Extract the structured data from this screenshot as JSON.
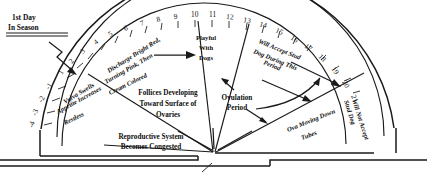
{
  "callout": {
    "line1": "1st Day",
    "line2": "In Season",
    "arrow_name": "first-day-arrow"
  },
  "scale": {
    "negative_days": [
      "-1",
      "-2",
      "-3",
      "-4"
    ],
    "positive_days": [
      "1",
      "2",
      "3",
      "4",
      "5",
      "6",
      "7",
      "8",
      "9",
      "10",
      "11",
      "12",
      "13",
      "14",
      "15",
      "16",
      "17",
      "18",
      "19",
      "20",
      "21"
    ],
    "axis_note": "Days of the season marked around the outer arc"
  },
  "outer_sectors": [
    {
      "name": "discharge",
      "lines": [
        "Discharge Bright Red,",
        "Turning Pink, Then",
        "Cream Colored"
      ],
      "range": "-4 to 10"
    },
    {
      "name": "playful-with-dogs",
      "lines": [
        "Playful",
        "With",
        "Dogs"
      ],
      "range": "10 to 12"
    },
    {
      "name": "will-accept-stud",
      "lines": [
        "Will Accept Stud",
        "Dog During This",
        "Period"
      ],
      "range": "12 to 19"
    },
    {
      "name": "will-not-accept-stud",
      "lines": [
        "Will Not Accept",
        "Stud Dog"
      ],
      "range": "19 to 21"
    }
  ],
  "inner_sectors": [
    {
      "name": "vulva-swells",
      "lines": [
        "Vulva Swells",
        "Appetite Increases",
        "Restless"
      ]
    },
    {
      "name": "follicles-developing",
      "lines": [
        "Follices Developing",
        "Toward Surface of",
        "Ovaries"
      ]
    },
    {
      "name": "ova-moving-down-tubes",
      "lines": [
        "Ova Moving Down",
        "Tubes"
      ]
    }
  ],
  "bottom_sector": {
    "name": "reproductive-system",
    "lines": [
      "Reproductive System",
      "Becomes Congested"
    ]
  },
  "ovulation": {
    "name": "ovulation-period",
    "lines": [
      "Ovulation",
      "Period"
    ]
  },
  "colors": {
    "ink": "#1a1a1a",
    "background": "#ffffff"
  }
}
